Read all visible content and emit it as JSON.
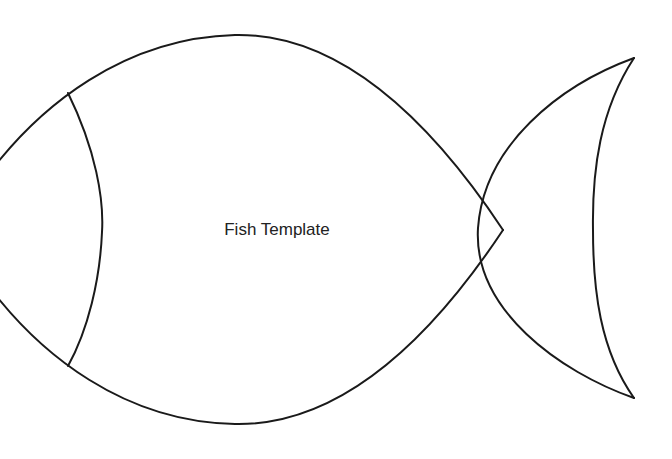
{
  "template": {
    "title": "Fish Template"
  },
  "colors": {
    "background": "#ffffff",
    "stroke": "#1a1a1a",
    "text": "#222222"
  }
}
